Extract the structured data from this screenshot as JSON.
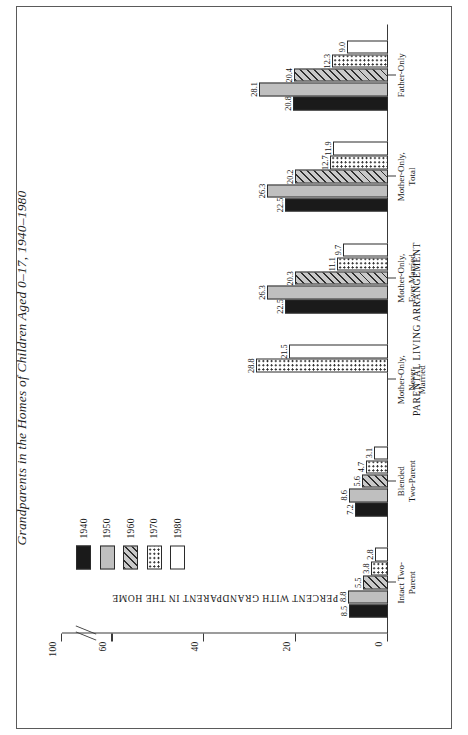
{
  "figure": {
    "title": "Grandparents in the Homes of Children Aged 0–17, 1940–1980"
  },
  "chart_data": {
    "type": "bar",
    "title": "Grandparents in the Homes of Children Aged 0–17, 1940–1980",
    "xlabel": "PARENTAL LIVING ARRANGEMENT",
    "ylabel": "PERCENT WITH GRANDPARENT IN THE HOME",
    "ylim": [
      0,
      100
    ],
    "yticks": [
      "0",
      "20",
      "40",
      "60",
      "100"
    ],
    "axis_break": true,
    "axis_break_between": [
      "60",
      "100"
    ],
    "grid": false,
    "legend_position": "upper-left",
    "orientation": "vertical-bars-rotated-page",
    "categories": [
      "Intact Two-Parent",
      "Blended Two-Parent",
      "Mother-Only,\nNever Married",
      "Mother-Only,\nEver Married",
      "Mother-Only,\nTotal",
      "Father-Only"
    ],
    "series": [
      {
        "name": "1940",
        "swatch": "solid-black",
        "values": [
          8.5,
          7.2,
          null,
          22.5,
          22.5,
          20.8
        ]
      },
      {
        "name": "1950",
        "swatch": "solid-gray",
        "values": [
          8.8,
          8.6,
          null,
          26.3,
          26.3,
          28.1
        ]
      },
      {
        "name": "1960",
        "swatch": "diagonal-hatch",
        "values": [
          5.5,
          5.6,
          null,
          20.3,
          20.2,
          20.4
        ]
      },
      {
        "name": "1970",
        "swatch": "dotted",
        "values": [
          3.8,
          4.7,
          28.8,
          11.1,
          12.7,
          12.3
        ]
      },
      {
        "name": "1980",
        "swatch": "open-white",
        "values": [
          2.8,
          3.1,
          21.5,
          9.7,
          11.9,
          9.0
        ]
      }
    ],
    "value_labels": {
      "Intact Two-Parent": [
        "8.5",
        "8.8",
        "5.5",
        "3.8",
        "2.8"
      ],
      "Blended Two-Parent": [
        "7.2",
        "8.6",
        "5.6",
        "4.7",
        "3.1"
      ],
      "Mother-Only, Never Married": [
        "",
        "",
        "",
        "28.8",
        "21.5"
      ],
      "Mother-Only, Ever Married": [
        "22.5",
        "26.3",
        "20.3",
        "11.1",
        "9.7"
      ],
      "Mother-Only, Total": [
        "22.5",
        "26.3",
        "20.2",
        "12.7",
        "11.9"
      ],
      "Father-Only": [
        "20.8",
        "28.1",
        "20.4",
        "12.3",
        "9.0"
      ]
    }
  },
  "legend": {
    "items": [
      {
        "label": "1940"
      },
      {
        "label": "1950"
      },
      {
        "label": "1960"
      },
      {
        "label": "1970"
      },
      {
        "label": "1980"
      }
    ]
  },
  "colors": {
    "series_1940": "#1a1a1a",
    "series_1950": "#bfbfbf",
    "series_1960": "#c9c9c9",
    "series_1970": "#ffffff",
    "series_1980": "#ffffff",
    "axis": "#3a3a3a",
    "frame": "#5a5a5a"
  }
}
